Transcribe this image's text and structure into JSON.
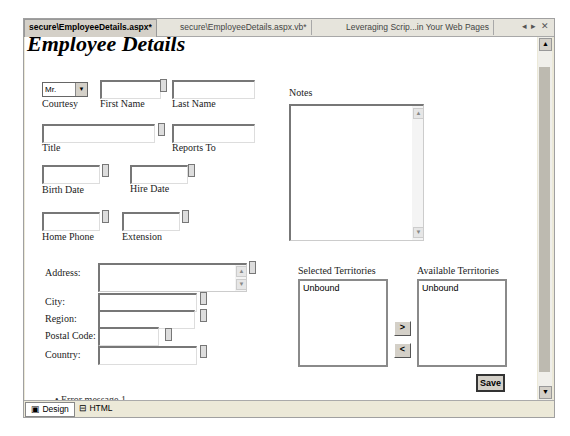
{
  "tabs": [
    {
      "label": "secure\\EmployeeDetails.aspx*",
      "active": true
    },
    {
      "label": "secure\\EmployeeDetails.aspx.vb*",
      "active": false
    },
    {
      "label": "Leveraging Scrip...in Your Web Pages",
      "active": false
    }
  ],
  "tab_controls": {
    "prev": "◂",
    "next": "▸",
    "close": "✕"
  },
  "page": {
    "title": "Employee Details",
    "courtesy": {
      "label": "Courtesy",
      "value": "Mr."
    },
    "fields": {
      "first_name": "First Name",
      "last_name": "Last Name",
      "title": "Title",
      "reports_to": "Reports To",
      "birth_date": "Birth Date",
      "hire_date": "Hire Date",
      "home_phone": "Home Phone",
      "extension": "Extension",
      "notes": "Notes",
      "address": "Address:",
      "city": "City:",
      "region": "Region:",
      "postal_code": "Postal Code:",
      "country": "Country:"
    },
    "selected_territories": {
      "label": "Selected Territories",
      "items": [
        "Unbound"
      ]
    },
    "available_territories": {
      "label": "Available Territories",
      "items": [
        "Unbound"
      ]
    },
    "buttons": {
      "add": ">",
      "remove": "<",
      "save": "Save"
    },
    "error_message": "Error message 1"
  },
  "view_tabs": [
    {
      "label": "Design",
      "icon": "design-icon",
      "active": true
    },
    {
      "label": "HTML",
      "icon": "html-icon",
      "active": false
    }
  ]
}
